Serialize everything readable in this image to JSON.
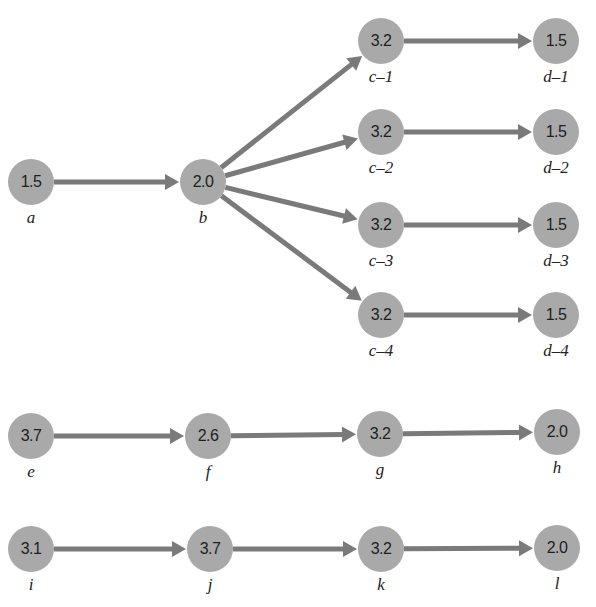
{
  "diagram": {
    "type": "activity-network",
    "colors": {
      "node_fill": "#a9a9a9",
      "edge": "#7a7a7a",
      "text": "#1e1e1e",
      "background": "#ffffff"
    },
    "nodes": [
      {
        "id": "a",
        "label": "a",
        "value": "1.5",
        "x": 31,
        "y": 182
      },
      {
        "id": "b",
        "label": "b",
        "value": "2.0",
        "x": 203,
        "y": 182
      },
      {
        "id": "c-1",
        "label": "c–1",
        "value": "3.2",
        "x": 381,
        "y": 41
      },
      {
        "id": "c-2",
        "label": "c–2",
        "value": "3.2",
        "x": 381,
        "y": 132
      },
      {
        "id": "c-3",
        "label": "c–3",
        "value": "3.2",
        "x": 381,
        "y": 225
      },
      {
        "id": "c-4",
        "label": "c–4",
        "value": "3.2",
        "x": 381,
        "y": 315
      },
      {
        "id": "d-1",
        "label": "d–1",
        "value": "1.5",
        "x": 556,
        "y": 41
      },
      {
        "id": "d-2",
        "label": "d–2",
        "value": "1.5",
        "x": 556,
        "y": 132
      },
      {
        "id": "d-3",
        "label": "d–3",
        "value": "1.5",
        "x": 556,
        "y": 225
      },
      {
        "id": "d-4",
        "label": "d–4",
        "value": "1.5",
        "x": 556,
        "y": 315
      },
      {
        "id": "e",
        "label": "e",
        "value": "3.7",
        "x": 31,
        "y": 436
      },
      {
        "id": "f",
        "label": "f",
        "value": "2.6",
        "x": 208,
        "y": 436
      },
      {
        "id": "g",
        "label": "g",
        "value": "3.2",
        "x": 380,
        "y": 434
      },
      {
        "id": "h",
        "label": "h",
        "value": "2.0",
        "x": 557,
        "y": 432
      },
      {
        "id": "i",
        "label": "i",
        "value": "3.1",
        "x": 31,
        "y": 549
      },
      {
        "id": "j",
        "label": "j",
        "value": "3.7",
        "x": 210,
        "y": 549
      },
      {
        "id": "k",
        "label": "k",
        "value": "3.2",
        "x": 381,
        "y": 549
      },
      {
        "id": "l",
        "label": "l",
        "value": "2.0",
        "x": 557,
        "y": 548
      }
    ],
    "edges": [
      {
        "from": "a",
        "to": "b"
      },
      {
        "from": "b",
        "to": "c-1"
      },
      {
        "from": "b",
        "to": "c-2"
      },
      {
        "from": "b",
        "to": "c-3"
      },
      {
        "from": "b",
        "to": "c-4"
      },
      {
        "from": "c-1",
        "to": "d-1"
      },
      {
        "from": "c-2",
        "to": "d-2"
      },
      {
        "from": "c-3",
        "to": "d-3"
      },
      {
        "from": "c-4",
        "to": "d-4"
      },
      {
        "from": "e",
        "to": "f"
      },
      {
        "from": "f",
        "to": "g"
      },
      {
        "from": "g",
        "to": "h"
      },
      {
        "from": "i",
        "to": "j"
      },
      {
        "from": "j",
        "to": "k"
      },
      {
        "from": "k",
        "to": "l"
      }
    ]
  }
}
